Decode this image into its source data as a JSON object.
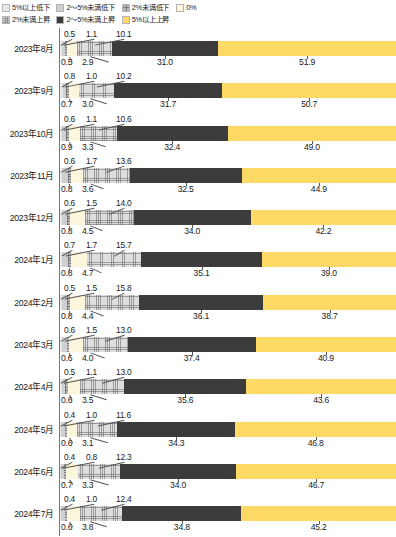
{
  "legend": {
    "rows": [
      [
        {
          "key": "down5",
          "label": "5%以上低下",
          "color": "#e8e8e8"
        },
        {
          "key": "down25",
          "label": "2～5%未満低下",
          "color": "#cfcfcf"
        },
        {
          "key": "down2",
          "label": "2%未満低下",
          "color": "#b9b9b9"
        },
        {
          "key": "zero",
          "label": "0%",
          "color": "#fbf6dc"
        }
      ],
      [
        {
          "key": "up2",
          "label": "2%未満上昇",
          "color": "#dedede"
        },
        {
          "key": "up25",
          "label": "2～5%未満上昇",
          "color": "#3c3c3c"
        },
        {
          "key": "up5",
          "label": "5%以上上昇",
          "color": "#ffd966"
        }
      ]
    ]
  },
  "chart_data": {
    "type": "bar",
    "orientation": "horizontal",
    "stacked": true,
    "title": "",
    "xlabel": "",
    "ylabel": "",
    "xlim": [
      0,
      100
    ],
    "grid": false,
    "legend_position": "top-left",
    "categories": [
      "2023年8月",
      "2023年9月",
      "2023年10月",
      "2023年11月",
      "2023年12月",
      "2024年1月",
      "2024年2月",
      "2024年3月",
      "2024年4月",
      "2024年5月",
      "2024年6月",
      "2024年7月"
    ],
    "series": [
      {
        "name": "5%以上低下",
        "key": "down5",
        "color": "#e8e8e8",
        "values": [
          0.5,
          0.8,
          0.6,
          0.6,
          0.6,
          0.7,
          0.5,
          0.6,
          0.5,
          0.4,
          0.4,
          0.4
        ]
      },
      {
        "name": "2～5%未満低下",
        "key": "down25",
        "color": "#cfcfcf",
        "values": [
          1.1,
          1.0,
          1.1,
          1.7,
          1.5,
          1.7,
          1.5,
          1.5,
          1.1,
          1.0,
          0.8,
          1.0
        ]
      },
      {
        "name": "2%未満低下",
        "key": "down2",
        "color": "#b9b9b9",
        "values": [
          0.5,
          0.7,
          0.9,
          0.8,
          0.8,
          0.8,
          0.8,
          0.6,
          0.6,
          0.6,
          0.7,
          0.6
        ]
      },
      {
        "name": "0%",
        "key": "zero",
        "color": "#fbf6dc",
        "values": [
          2.9,
          3.0,
          3.3,
          3.6,
          4.5,
          4.7,
          4.4,
          4.0,
          3.5,
          3.1,
          3.3,
          3.8
        ]
      },
      {
        "name": "2%未満上昇",
        "key": "up2",
        "color": "#dedede",
        "values": [
          10.1,
          10.2,
          10.6,
          13.6,
          14.0,
          15.7,
          15.8,
          13.0,
          13.0,
          11.6,
          12.3,
          12.4
        ]
      },
      {
        "name": "2～5%未満上昇",
        "key": "up25",
        "color": "#3c3c3c",
        "values": [
          31.0,
          31.7,
          32.4,
          32.5,
          34.0,
          35.1,
          36.1,
          37.4,
          35.6,
          34.3,
          34.0,
          34.8
        ]
      },
      {
        "name": "5%以上上昇",
        "key": "up5",
        "color": "#ffd966",
        "values": [
          51.9,
          50.7,
          49.0,
          44.9,
          42.2,
          39.0,
          38.7,
          40.9,
          43.6,
          46.8,
          46.7,
          45.2
        ]
      }
    ],
    "rows": [
      {
        "category": "2023年8月",
        "top_labels": [
          "0.5",
          "1.1",
          "10.1"
        ],
        "bottom_labels": [
          "0.5",
          "2.9",
          "31.0",
          "51.9"
        ]
      },
      {
        "category": "2023年9月",
        "top_labels": [
          "0.8",
          "1.0",
          "10.2"
        ],
        "bottom_labels": [
          "0.7",
          "3.0",
          "31.7",
          "50.7"
        ]
      },
      {
        "category": "2023年10月",
        "top_labels": [
          "0.6",
          "1.1",
          "10.6"
        ],
        "bottom_labels": [
          "0.9",
          "3.3",
          "32.4",
          "49.0"
        ]
      },
      {
        "category": "2023年11月",
        "top_labels": [
          "0.6",
          "1.7",
          "13.6"
        ],
        "bottom_labels": [
          "0.8",
          "3.6",
          "32.5",
          "44.9"
        ]
      },
      {
        "category": "2023年12月",
        "top_labels": [
          "0.6",
          "1.5",
          "14.0"
        ],
        "bottom_labels": [
          "0.8",
          "4.5",
          "34.0",
          "42.2"
        ]
      },
      {
        "category": "2024年1月",
        "top_labels": [
          "0.7",
          "1.7",
          "15.7"
        ],
        "bottom_labels": [
          "0.8",
          "4.7",
          "35.1",
          "39.0"
        ]
      },
      {
        "category": "2024年2月",
        "top_labels": [
          "0.5",
          "1.5",
          "15.8"
        ],
        "bottom_labels": [
          "0.8",
          "4.4",
          "36.1",
          "38.7"
        ]
      },
      {
        "category": "2024年3月",
        "top_labels": [
          "0.6",
          "1.5",
          "13.0"
        ],
        "bottom_labels": [
          "0.6",
          "4.0",
          "37.4",
          "40.9"
        ]
      },
      {
        "category": "2024年4月",
        "top_labels": [
          "0.5",
          "1.1",
          "13.0"
        ],
        "bottom_labels": [
          "0.6",
          "3.5",
          "35.6",
          "43.6"
        ]
      },
      {
        "category": "2024年5月",
        "top_labels": [
          "0.4",
          "1.0",
          "11.6"
        ],
        "bottom_labels": [
          "0.6",
          "3.1",
          "34.3",
          "46.8"
        ]
      },
      {
        "category": "2024年6月",
        "top_labels": [
          "0.4",
          "0.8",
          "12.3"
        ],
        "bottom_labels": [
          "0.7",
          "3.3",
          "34.0",
          "46.7"
        ]
      },
      {
        "category": "2024年7月",
        "top_labels": [
          "0.4",
          "1.0",
          "12.4"
        ],
        "bottom_labels": [
          "0.6",
          "3.8",
          "34.8",
          "45.2"
        ]
      }
    ]
  }
}
